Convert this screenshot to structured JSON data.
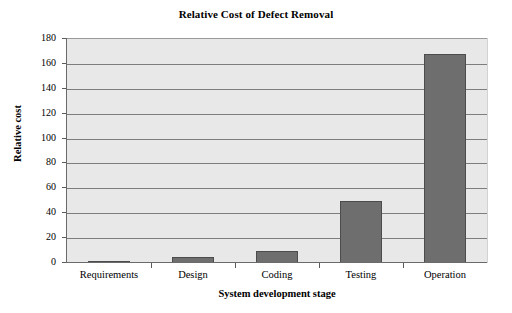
{
  "chart_data": {
    "type": "bar",
    "title": "Relative Cost of Defect Removal",
    "xlabel": "System development stage",
    "ylabel": "Relative cost",
    "categories": [
      "Requirements",
      "Design",
      "Coding",
      "Testing",
      "Operation"
    ],
    "values": [
      1,
      5,
      10,
      50,
      168
    ],
    "ylim": [
      0,
      180
    ],
    "ytick_values": [
      0,
      20,
      40,
      60,
      80,
      100,
      120,
      140,
      160,
      180
    ],
    "ytick_labels": [
      "0",
      "20",
      "40",
      "60",
      "80",
      "100",
      "120",
      "140",
      "160",
      "180"
    ],
    "grid": "horizontal",
    "legend": "none",
    "series": [
      {
        "name": "Relative cost",
        "values": [
          1,
          5,
          10,
          50,
          168
        ]
      }
    ],
    "colors": {
      "bar_fill": "#6e6e6e",
      "bar_edge": "#4c4c4c",
      "plot_background": "#e8e8e8",
      "gridline": "#7d7d7d",
      "axis": "#6a6a6a",
      "figure_background": "#ffffff",
      "text": "#000000"
    }
  }
}
